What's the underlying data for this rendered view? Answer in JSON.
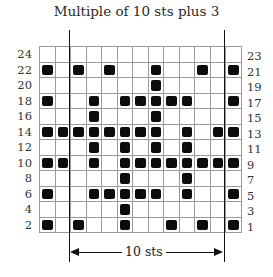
{
  "title": "Multiple of 10 sts plus 3",
  "repeat_label": "10 sts",
  "columns": 13,
  "left_labels": [
    "24",
    "22",
    "20",
    "18",
    "16",
    "14",
    "12",
    "10",
    "8",
    "6",
    "4",
    "2"
  ],
  "right_labels": [
    "23",
    "21",
    "19",
    "17",
    "15",
    "13",
    "11",
    "9",
    "7",
    "5",
    "3",
    "1"
  ],
  "repeat_columns": {
    "start": 3,
    "end": 12
  },
  "rows": [
    {
      "row": 24,
      "filled": []
    },
    {
      "row": 22,
      "filled": [
        1,
        3,
        5,
        8,
        11,
        13
      ]
    },
    {
      "row": 20,
      "filled": [
        8
      ]
    },
    {
      "row": 18,
      "filled": [
        1,
        4,
        6,
        7,
        8,
        9,
        10,
        13
      ]
    },
    {
      "row": 16,
      "filled": [
        4,
        8
      ]
    },
    {
      "row": 14,
      "filled": [
        1,
        2,
        3,
        4,
        5,
        6,
        7,
        8,
        10,
        12,
        13
      ]
    },
    {
      "row": 12,
      "filled": [
        4,
        6,
        8,
        10
      ]
    },
    {
      "row": 10,
      "filled": [
        1,
        2,
        4,
        6,
        7,
        8,
        9,
        10,
        11,
        12,
        13
      ]
    },
    {
      "row": 8,
      "filled": [
        6,
        10
      ]
    },
    {
      "row": 6,
      "filled": [
        1,
        4,
        5,
        6,
        7,
        8,
        10,
        13
      ]
    },
    {
      "row": 4,
      "filled": [
        6
      ]
    },
    {
      "row": 2,
      "filled": [
        1,
        3,
        6,
        9,
        11,
        13
      ]
    }
  ],
  "legend": {
    "filled_color": "#0c0c0c",
    "grid_color": "#9a9a9a"
  }
}
